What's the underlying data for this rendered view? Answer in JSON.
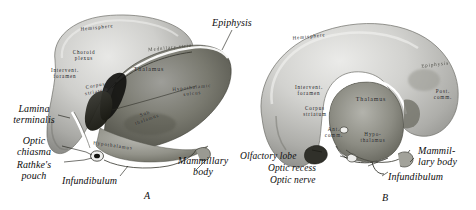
{
  "plate": {
    "background_color": "#ffffff",
    "ink_color": "#0d0d0d",
    "figure_a_letter": "A",
    "figure_b_letter": "B"
  },
  "figure_a": {
    "external_labels": [
      {
        "name": "epiphysis",
        "text": "Epiphysis"
      },
      {
        "name": "lamina-terminalis",
        "text": "Lamina\nterminalis"
      },
      {
        "name": "optic-chiasma",
        "text": "Optic\nchiasma"
      },
      {
        "name": "rathkes-pouch",
        "text": "Rathke's\npouch"
      },
      {
        "name": "infundibulum",
        "text": "Infundibulum"
      },
      {
        "name": "mammillary-body",
        "text": "Mammillary\nbody"
      }
    ],
    "internal_labels": [
      {
        "name": "hemisphere",
        "text": "Hemisphere"
      },
      {
        "name": "choroid-plexus",
        "text": "Choroid\nplexus"
      },
      {
        "name": "interventricular-foramen",
        "text": "Intervent.\nforamen"
      },
      {
        "name": "corpus-striatum",
        "text": "Corpus\nstriatum"
      },
      {
        "name": "thalamus",
        "text": "Thalamus"
      },
      {
        "name": "medullary-stria",
        "text": "Medullary stria"
      },
      {
        "name": "hypothalamic-sulcus",
        "text": "Hypothalamic\nsulcus"
      },
      {
        "name": "sub-thalamus",
        "text": "Sub\nthalamus"
      },
      {
        "name": "hypothalamus",
        "text": "Hypothalamus"
      }
    ]
  },
  "figure_b": {
    "external_labels": [
      {
        "name": "olfactory-lobe",
        "text": "Olfactory lobe"
      },
      {
        "name": "optic-recess",
        "text": "Optic recess"
      },
      {
        "name": "optic-nerve",
        "text": "Optic nerve"
      },
      {
        "name": "infundibulum",
        "text": "Infundibulum"
      },
      {
        "name": "mammillary-body",
        "text": "Mammil-\nlary body"
      }
    ],
    "internal_labels": [
      {
        "name": "hemisphere",
        "text": "Hemisphere"
      },
      {
        "name": "epiphysis",
        "text": "Epiphysis"
      },
      {
        "name": "interventricular-foramen",
        "text": "Intervent.\nforamen"
      },
      {
        "name": "corpus-striatum",
        "text": "Corpus\nstriatum"
      },
      {
        "name": "anterior-commissure",
        "text": "Ant.\ncomm."
      },
      {
        "name": "thalamus",
        "text": "Thalamus"
      },
      {
        "name": "posterior-commissure",
        "text": "Post.\ncomm."
      },
      {
        "name": "hypothalamus",
        "text": "Hypo-\nthalamus"
      }
    ]
  }
}
